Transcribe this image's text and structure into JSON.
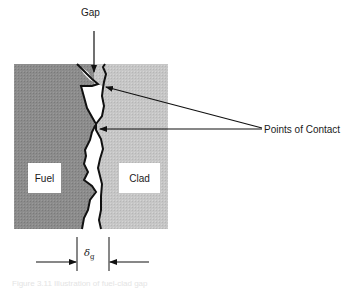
{
  "diagram": {
    "labels": {
      "gap": "Gap",
      "points_of_contact": "Points of Contact",
      "fuel": "Fuel",
      "clad": "Clad",
      "gap_width_symbol": "δ",
      "gap_width_subscript": "g"
    },
    "caption": "Figure 3.11  Illustration of fuel-clad gap",
    "colors": {
      "fuel_fill": "#8a8a8a",
      "clad_fill": "#c4c4c4",
      "gap_fill": "#ffffff",
      "line": "#111111"
    }
  }
}
